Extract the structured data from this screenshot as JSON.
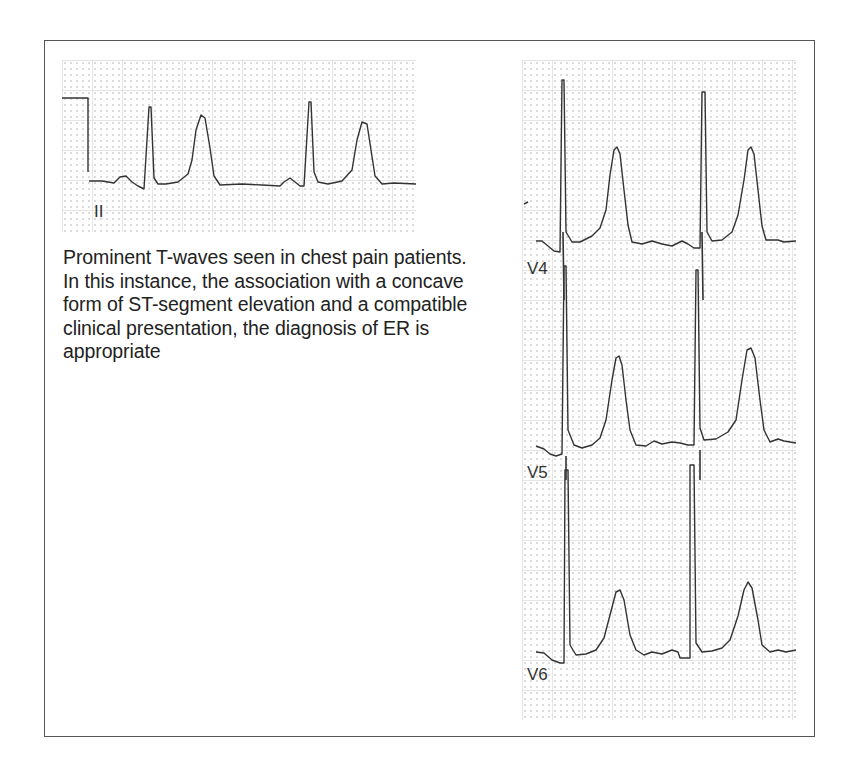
{
  "figure": {
    "caption": "Prominent T-waves seen in chest pain patients. In this instance, the association with a concave form of ST-segment elevation and a compatible clinical presentation, the diagnosis of ER is appropriate",
    "left_strip": {
      "lead": "II",
      "x": 62,
      "y": 60,
      "width": 354,
      "height": 172
    },
    "right_strip": {
      "x": 522,
      "y": 60,
      "width": 274,
      "height": 660,
      "leads": [
        {
          "name": "V4",
          "label_y": 214
        },
        {
          "name": "V5",
          "label_y": 418
        },
        {
          "name": "V6",
          "label_y": 620
        }
      ]
    },
    "colors": {
      "trace": "#333333",
      "grid_major": "#d8d8d8",
      "grid_dot": "#9a9a9a",
      "border": "#555555"
    }
  }
}
